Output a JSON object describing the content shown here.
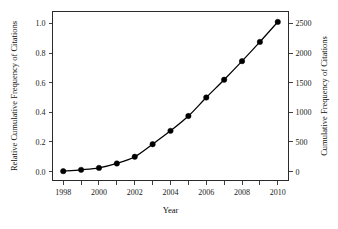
{
  "chart_data": {
    "type": "line",
    "title": "",
    "subtitle": "",
    "xlabel": "Year",
    "ylabel": "Relative Cumulative Frequency of Citations",
    "y2label": "Cumulative Frequency of Citations",
    "x": [
      1998,
      1999,
      2000,
      2001,
      2002,
      2003,
      2004,
      2005,
      2006,
      2007,
      2008,
      2009,
      2010
    ],
    "series": [
      {
        "name": "Relative Cumulative Frequency of Citations",
        "values": [
          0.003,
          0.012,
          0.025,
          0.055,
          0.1,
          0.185,
          0.275,
          0.375,
          0.5,
          0.62,
          0.745,
          0.875,
          1.01
        ],
        "marker": "filled-circle",
        "line_color": "#000000",
        "marker_color": "#000000"
      },
      {
        "name": "Cumulative Frequency of Citations",
        "axis": "right",
        "values": [
          8,
          30,
          63,
          138,
          250,
          463,
          688,
          938,
          1250,
          1550,
          1863,
          2188,
          2525
        ]
      }
    ],
    "xlim": [
      1997.4,
      2010.6
    ],
    "ylim": [
      -0.06,
      1.08
    ],
    "y2lim": [
      -150,
      2700
    ],
    "xticks": [
      1998,
      1999,
      2000,
      2001,
      2002,
      2003,
      2004,
      2005,
      2006,
      2007,
      2008,
      2009,
      2010
    ],
    "xticklabels": [
      "1998",
      "",
      "2000",
      "",
      "2002",
      "",
      "2004",
      "",
      "2006",
      "",
      "2008",
      "",
      "2010"
    ],
    "yticks": [
      0.0,
      0.2,
      0.4,
      0.6,
      0.8,
      1.0
    ],
    "yticklabels": [
      "0.0",
      "0.2",
      "0.4",
      "0.6",
      "0.8",
      "1.0"
    ],
    "y2ticks": [
      0,
      500,
      1000,
      1500,
      2000,
      2500
    ],
    "y2ticklabels": [
      "0",
      "500",
      "1000",
      "1500",
      "2000",
      "2500"
    ],
    "grid": false,
    "legend": false,
    "background_color": "#ffffff",
    "frame_color": "#2b2b2b"
  }
}
